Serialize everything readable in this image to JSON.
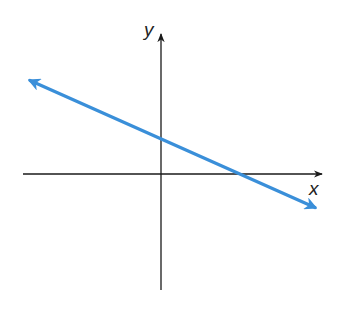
{
  "diagram": {
    "type": "coordinate-plane-line",
    "axes": {
      "x_label": "x",
      "y_label": "y",
      "color": "#1a1a1a",
      "origin_px": [
        161,
        174
      ],
      "x_range_px": [
        23,
        322
      ],
      "y_range_px": [
        40,
        290
      ]
    },
    "line": {
      "color": "#3a8fd9",
      "description": "Straight line with negative slope, arrows on both ends",
      "start_px": [
        27,
        79
      ],
      "end_px": [
        318,
        209
      ],
      "y_intercept_px": [
        161,
        137
      ],
      "x_intercept_px": [
        242,
        174
      ],
      "slope_sign": "negative",
      "y_intercept_sign": "positive",
      "x_intercept_sign": "positive"
    }
  }
}
